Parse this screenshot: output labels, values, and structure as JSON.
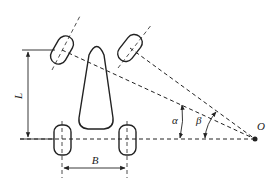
{
  "diagram": {
    "labels": {
      "wheelbase": "L",
      "track": "B",
      "outer_angle": "α",
      "inner_angle": "β",
      "turn_center": "O"
    },
    "colors": {
      "line": "#222222",
      "background": "#ffffff"
    }
  }
}
